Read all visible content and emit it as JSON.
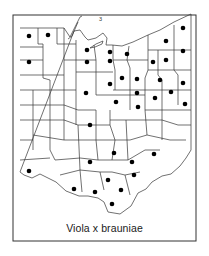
{
  "map": {
    "title": "Viola x brauniae",
    "region": "Ohio counties",
    "annotation_label": "3",
    "colors": {
      "border": "#333333",
      "dot": "#000000",
      "background": "#ffffff",
      "lake": "#ffffff"
    },
    "frame": {
      "x": 13,
      "y": 15,
      "width": 183,
      "height": 226
    },
    "dots": [
      {
        "x": 29,
        "y": 36
      },
      {
        "x": 48,
        "y": 35
      },
      {
        "x": 29,
        "y": 62
      },
      {
        "x": 87,
        "y": 50
      },
      {
        "x": 110,
        "y": 52
      },
      {
        "x": 127,
        "y": 54
      },
      {
        "x": 87,
        "y": 62
      },
      {
        "x": 110,
        "y": 61
      },
      {
        "x": 153,
        "y": 62
      },
      {
        "x": 166,
        "y": 41
      },
      {
        "x": 166,
        "y": 60
      },
      {
        "x": 183,
        "y": 28
      },
      {
        "x": 183,
        "y": 51
      },
      {
        "x": 122,
        "y": 78
      },
      {
        "x": 137,
        "y": 79
      },
      {
        "x": 160,
        "y": 80
      },
      {
        "x": 110,
        "y": 84
      },
      {
        "x": 183,
        "y": 83
      },
      {
        "x": 86,
        "y": 93
      },
      {
        "x": 137,
        "y": 93
      },
      {
        "x": 171,
        "y": 92
      },
      {
        "x": 155,
        "y": 98
      },
      {
        "x": 116,
        "y": 102
      },
      {
        "x": 185,
        "y": 104
      },
      {
        "x": 138,
        "y": 107
      },
      {
        "x": 90,
        "y": 125
      },
      {
        "x": 114,
        "y": 153
      },
      {
        "x": 154,
        "y": 154
      },
      {
        "x": 90,
        "y": 162
      },
      {
        "x": 132,
        "y": 162
      },
      {
        "x": 29,
        "y": 171
      },
      {
        "x": 134,
        "y": 175
      },
      {
        "x": 108,
        "y": 180
      },
      {
        "x": 74,
        "y": 189
      },
      {
        "x": 95,
        "y": 192
      },
      {
        "x": 121,
        "y": 190
      },
      {
        "x": 112,
        "y": 204
      }
    ]
  }
}
